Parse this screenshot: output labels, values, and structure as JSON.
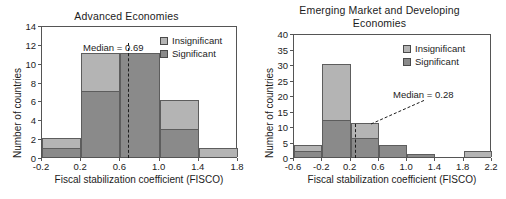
{
  "figure": {
    "axis_label_x": "Fiscal stabilization coefficient (FISCO)",
    "axis_label_y": "Number of countries",
    "legend": {
      "insignificant": "Insignificant",
      "significant": "Significant"
    },
    "colors": {
      "insignificant": "#b4b4b4",
      "significant": "#8a8a8a",
      "axis": "#555555",
      "text": "#1c1c1c"
    }
  },
  "chart_data": [
    {
      "type": "bar",
      "title": "Advanced Economies",
      "xlabel": "Fiscal stabilization coefficient (FISCO)",
      "ylabel": "Number of countries",
      "xlim": [
        -0.2,
        1.8
      ],
      "ylim": [
        0,
        14
      ],
      "xticks": [
        "-0.2",
        "0.2",
        "0.6",
        "1.0",
        "1.4",
        "1.8"
      ],
      "xtick_values": [
        -0.2,
        0.2,
        0.6,
        1.0,
        1.4,
        1.8
      ],
      "yticks": [
        "0",
        "2",
        "4",
        "6",
        "8",
        "10",
        "12",
        "14"
      ],
      "ytick_values": [
        0,
        2,
        4,
        6,
        8,
        10,
        12,
        14
      ],
      "grid": false,
      "stacked": true,
      "legend_position": "top-right",
      "bin_edges": [
        -0.2,
        0.2,
        0.6,
        1.0,
        1.4,
        1.8
      ],
      "categories": [
        "-0.2 to 0.2",
        "0.2 to 0.6",
        "0.6 to 1.0",
        "1.0 to 1.4",
        "1.4 to 1.8"
      ],
      "series": [
        {
          "name": "Significant",
          "values": [
            1,
            7,
            11,
            3,
            0
          ]
        },
        {
          "name": "Insignificant",
          "values": [
            1,
            4,
            0,
            3,
            1
          ]
        }
      ],
      "totals": [
        2,
        11,
        11,
        6,
        1
      ],
      "annotations": [
        {
          "name": "median",
          "text": "Median = 0.69",
          "value": 0.69
        }
      ]
    },
    {
      "type": "bar",
      "title_line1": "Emerging Market and Developing",
      "title_line2": "Economies",
      "title": "Emerging Market and Developing Economies",
      "xlabel": "Fiscal stabilization coefficient (FISCO)",
      "ylabel": "Number of countries",
      "xlim": [
        -0.6,
        2.2
      ],
      "ylim": [
        0,
        40
      ],
      "xticks": [
        "-0.6",
        "-0.2",
        "0.2",
        "0.6",
        "1.0",
        "1.4",
        "1.8",
        "2.2"
      ],
      "xtick_values": [
        -0.6,
        -0.2,
        0.2,
        0.6,
        1.0,
        1.4,
        1.8,
        2.2
      ],
      "yticks": [
        "0",
        "5",
        "10",
        "15",
        "20",
        "25",
        "30",
        "35",
        "40"
      ],
      "ytick_values": [
        0,
        5,
        10,
        15,
        20,
        25,
        30,
        35,
        40
      ],
      "grid": false,
      "stacked": true,
      "legend_position": "top-right",
      "bin_edges": [
        -0.6,
        -0.2,
        0.2,
        0.6,
        1.0,
        1.4,
        1.8,
        2.2
      ],
      "categories": [
        "-0.6 to -0.2",
        "-0.2 to 0.2",
        "0.2 to 0.6",
        "0.6 to 1.0",
        "1.0 to 1.4",
        "1.4 to 1.8",
        "1.8 to 2.2"
      ],
      "series": [
        {
          "name": "Significant",
          "values": [
            2,
            12,
            6,
            4,
            1,
            0,
            0
          ]
        },
        {
          "name": "Insignificant",
          "values": [
            2,
            18,
            5,
            0,
            0,
            0,
            2
          ]
        }
      ],
      "totals": [
        4,
        30,
        11,
        4,
        1,
        0,
        2
      ],
      "annotations": [
        {
          "name": "median",
          "text": "Median = 0.28",
          "value": 0.28
        }
      ]
    }
  ]
}
